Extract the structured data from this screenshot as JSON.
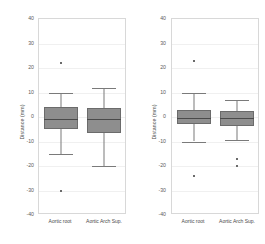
{
  "figure": {
    "background": "#ffffff",
    "box_fill": "#8e8e8e",
    "line_color": "#7a7a7a"
  },
  "chart_data": [
    {
      "type": "box",
      "panel": "left",
      "title": "",
      "xlabel": "",
      "ylabel": "Distance (mm)",
      "ylim": [
        -40,
        40
      ],
      "yticks": [
        40,
        30,
        20,
        10,
        0,
        -10,
        -20,
        -30,
        -40
      ],
      "ytick_labels": [
        "40",
        "30",
        "20",
        "10",
        "0",
        "-10",
        "-20",
        "-30",
        "-40"
      ],
      "grid": true,
      "legend": "none",
      "categories": [
        "Aortic root",
        "Aortic Arch Sup."
      ],
      "boxes": [
        {
          "name": "Aortic root",
          "whisker_low": -15,
          "q1": -5,
          "median": -1,
          "q3": 4,
          "whisker_high": 10,
          "outliers": [
            22,
            -30
          ]
        },
        {
          "name": "Aortic Arch Sup.",
          "whisker_low": -20,
          "q1": -6.5,
          "median": -1,
          "q3": 3.5,
          "whisker_high": 12,
          "outliers": []
        }
      ]
    },
    {
      "type": "box",
      "panel": "right",
      "title": "",
      "xlabel": "",
      "ylabel": "Distance (mm)",
      "ylim": [
        -40,
        40
      ],
      "yticks": [
        40,
        30,
        20,
        10,
        0,
        -10,
        -20,
        -30,
        -40
      ],
      "ytick_labels": [
        "40",
        "30",
        "20",
        "10",
        "0",
        "-10",
        "-20",
        "-30",
        "-40"
      ],
      "grid": true,
      "legend": "none",
      "categories": [
        "Aortic root",
        "Aortic Arch Sup."
      ],
      "boxes": [
        {
          "name": "Aortic root",
          "whisker_low": -10,
          "q1": -3,
          "median": -0.5,
          "q3": 3,
          "whisker_high": 10,
          "outliers": [
            23,
            -24
          ]
        },
        {
          "name": "Aortic Arch Sup.",
          "whisker_low": -9.5,
          "q1": -3.5,
          "median": -0.5,
          "q3": 2.5,
          "whisker_high": 7,
          "outliers": [
            -17,
            -20
          ]
        }
      ]
    }
  ]
}
